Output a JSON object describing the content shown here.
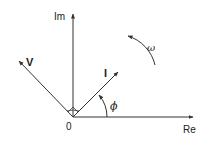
{
  "diagram": {
    "type": "phasor-diagram",
    "colors": {
      "stroke": "#333333",
      "text": "#222222",
      "background": "#ffffff"
    },
    "origin": {
      "label": "0",
      "x": 73,
      "y": 117
    },
    "axes": {
      "imaginary": {
        "label": "Im",
        "direction": "up"
      },
      "real": {
        "label": "Re",
        "direction": "right"
      }
    },
    "phasors": [
      {
        "name": "voltage",
        "label": "V",
        "angle_deg": 135,
        "relation": "perpendicular to I (right-angle marker)"
      },
      {
        "name": "current",
        "label": "I",
        "angle_deg": 45
      }
    ],
    "angles": [
      {
        "label": "ϕ",
        "between": [
          "Re",
          "I"
        ]
      }
    ],
    "rotation": {
      "label": "ω",
      "direction": "counter-clockwise"
    }
  }
}
